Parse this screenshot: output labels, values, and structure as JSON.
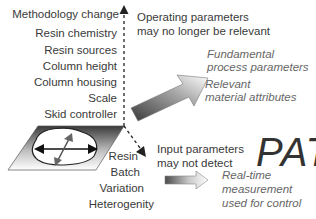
{
  "diagram": {
    "vertical_axis_labels": [
      "Methodology change",
      "Resin chemistry",
      "Resin sources",
      "Column height",
      "Column housing",
      "Scale",
      "Skid controller"
    ],
    "operating_note": {
      "line1": "Operating parameters",
      "line2": "may no longer be relevant"
    },
    "big_arrow_labels": {
      "fundamental_1": "Fundamental",
      "fundamental_2": "process parameters",
      "relevant_1": "Relevant",
      "relevant_2": "material attributes"
    },
    "pat_label": "PAT",
    "input_note": {
      "line1": "Input parameters",
      "line2": "may not detect"
    },
    "diagonal_axis_labels": [
      "Resin",
      "Batch",
      "Variation",
      "Heterogenity"
    ],
    "realtime_note": {
      "line1": "Real-time",
      "line2": "measurement",
      "line3": "used for control"
    }
  }
}
